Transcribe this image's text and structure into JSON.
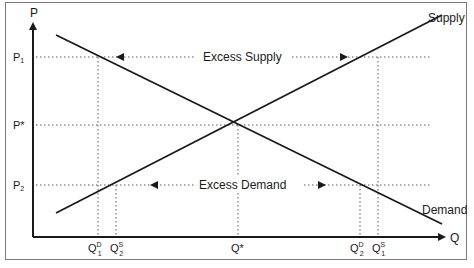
{
  "diagram": {
    "title": "",
    "axes": {
      "y_label": "P",
      "x_label": "Q"
    },
    "price_levels": [
      {
        "id": "p1",
        "label": "P",
        "sub": "1",
        "y": 57
      },
      {
        "id": "pstar",
        "label": "P*",
        "sub": "",
        "y": 125
      },
      {
        "id": "p2",
        "label": "P",
        "sub": "2",
        "y": 185
      }
    ],
    "quantity_levels": [
      {
        "id": "qd1",
        "label": "Q",
        "sup": "D",
        "sub": "1",
        "x": 98
      },
      {
        "id": "qs2",
        "label": "Q",
        "sup": "S",
        "sub": "2",
        "x": 116
      },
      {
        "id": "qstar",
        "label": "Q*",
        "sup": "",
        "sub": "",
        "x": 238
      },
      {
        "id": "qd2",
        "label": "Q",
        "sup": "D",
        "sub": "2",
        "x": 360
      },
      {
        "id": "qs1",
        "label": "Q",
        "sup": "S",
        "sub": "1",
        "x": 378
      }
    ],
    "curves": {
      "supply": {
        "label": "Supply",
        "from": [
          56,
          213
        ],
        "to": [
          442,
          15
        ]
      },
      "demand": {
        "label": "Demand",
        "from": [
          56,
          35
        ],
        "to": [
          442,
          224
        ]
      }
    },
    "annotations": {
      "excess_supply": "Excess Supply",
      "excess_demand": "Excess Demand"
    },
    "colors": {
      "line": "#1a1a1a",
      "dotted": "#555555",
      "frame": "#7a7a7a"
    }
  }
}
